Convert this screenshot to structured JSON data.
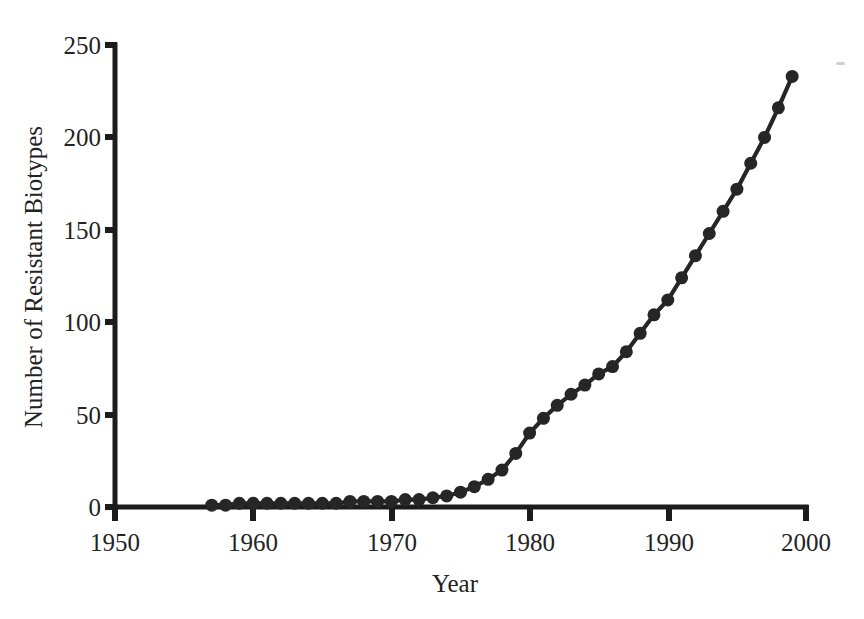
{
  "figure": {
    "background_color": "#ffffff",
    "ink_color": "#262626",
    "axis_color": "#1c1c1c"
  },
  "chart_data": {
    "type": "line",
    "title": "",
    "subtitle": "",
    "xlabel": "Year",
    "ylabel": "Number of Resistant Biotypes",
    "xlim": [
      1950,
      2000
    ],
    "ylim": [
      0,
      250
    ],
    "xticks": [
      1950,
      1960,
      1970,
      1980,
      1990,
      2000
    ],
    "xticklabels": [
      "1950",
      "1960",
      "1970",
      "1980",
      "1990",
      "2000"
    ],
    "yticks": [
      0,
      50,
      100,
      150,
      200,
      250
    ],
    "yticklabels": [
      "0",
      "50",
      "100",
      "150",
      "200",
      "250"
    ],
    "grid": false,
    "legend": null,
    "legend_position": "none",
    "marker": "circle",
    "marker_size_px": 13,
    "line_width_px": 4,
    "series": [
      {
        "name": "Resistant biotypes",
        "color": "#262626",
        "x": [
          1957,
          1958,
          1959,
          1960,
          1961,
          1962,
          1963,
          1964,
          1965,
          1966,
          1967,
          1968,
          1969,
          1970,
          1971,
          1972,
          1973,
          1974,
          1975,
          1976,
          1977,
          1978,
          1979,
          1980,
          1981,
          1982,
          1983,
          1984,
          1985,
          1986,
          1987,
          1988,
          1989,
          1990,
          1991,
          1992,
          1993,
          1994,
          1995,
          1996,
          1997,
          1998,
          1999
        ],
        "values": [
          1,
          1,
          2,
          2,
          2,
          2,
          2,
          2,
          2,
          2,
          3,
          3,
          3,
          3,
          4,
          4,
          5,
          6,
          8,
          11,
          15,
          20,
          29,
          40,
          48,
          55,
          61,
          66,
          72,
          76,
          84,
          94,
          104,
          112,
          124,
          136,
          148,
          160,
          172,
          186,
          200,
          216,
          233
        ]
      }
    ],
    "annotations": []
  },
  "axis_labels": {
    "y_axis_title": "Number of Resistant Biotypes",
    "x_axis_title": "Year"
  }
}
